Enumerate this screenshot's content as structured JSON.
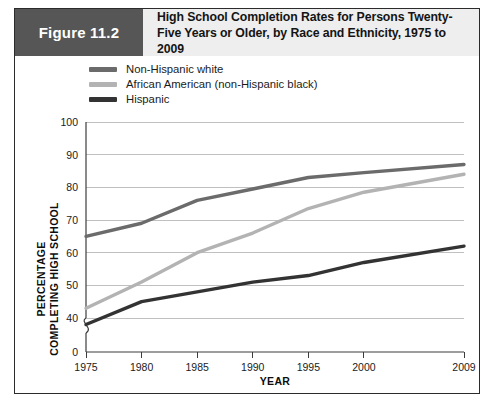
{
  "figure": {
    "tag": "Figure 11.2",
    "title": "High School Completion Rates for Persons Twenty-Five Years or Older, by Race and Ethnicity, 1975 to 2009"
  },
  "colors": {
    "series_white": "#6b6b6b",
    "series_african_american": "#b3b3b3",
    "series_hispanic": "#333333",
    "header_band": "#eeeeee",
    "tag_box": "#565656",
    "frame": "#2b2b2b",
    "gridline": "#b9b9b9",
    "axis": "#3c3c3c"
  },
  "legend": {
    "items": [
      {
        "label": "Non-Hispanic white",
        "color": "#6b6b6b"
      },
      {
        "label": "African American (non-Hispanic black)",
        "color": "#b3b3b3"
      },
      {
        "label": "Hispanic",
        "color": "#333333"
      }
    ]
  },
  "chart_data": {
    "type": "line",
    "title": "High School Completion Rates for Persons Twenty-Five Years or Older, by Race and Ethnicity, 1975 to 2009",
    "xlabel": "YEAR",
    "ylabel": "PERCENTAGE COMPLETING HIGH SCHOOL",
    "ylabel_line1": "PERCENTAGE",
    "ylabel_line2": "COMPLETING HIGH SCHOOL",
    "categories": [
      "1975",
      "1980",
      "1985",
      "1990",
      "1995",
      "2000",
      "2009"
    ],
    "x": [
      1975,
      1980,
      1985,
      1990,
      1995,
      2000,
      2009
    ],
    "ylim": [
      40,
      100
    ],
    "yticks": [
      40,
      50,
      60,
      70,
      80,
      90,
      100
    ],
    "ytick_labels": [
      "40",
      "50",
      "60",
      "70",
      "80",
      "90",
      "100"
    ],
    "zero_tick_label": "0",
    "axis_break": true,
    "grid": true,
    "legend_position": "top-left",
    "series": [
      {
        "name": "Non-Hispanic white",
        "color": "#6b6b6b",
        "values": [
          65,
          69,
          76,
          79.5,
          83,
          84.5,
          87
        ]
      },
      {
        "name": "African American (non-Hispanic black)",
        "color": "#b3b3b3",
        "values": [
          43,
          51,
          60,
          66,
          73.5,
          78.5,
          84
        ]
      },
      {
        "name": "Hispanic",
        "color": "#333333",
        "values": [
          38,
          45,
          48,
          51,
          53,
          57,
          62
        ]
      }
    ]
  }
}
